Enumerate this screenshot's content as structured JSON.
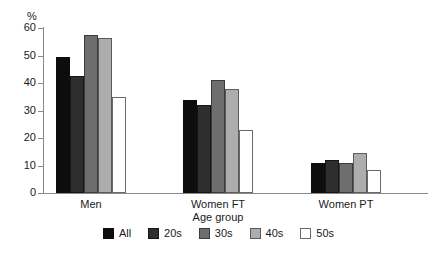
{
  "chart_data": {
    "type": "bar",
    "title": "",
    "xlabel": "Age group",
    "ylabel": "%",
    "ylim": [
      0,
      60
    ],
    "yticks": [
      0,
      10,
      20,
      30,
      40,
      50,
      60
    ],
    "ytick_labels": [
      "0",
      "10",
      "20",
      "30",
      "40",
      "50",
      "60"
    ],
    "grid": false,
    "legend_position": "bottom",
    "categories": [
      "Men",
      "Women FT",
      "Women PT"
    ],
    "series": [
      {
        "name": "All",
        "color": "#0d0d0d",
        "values": [
          49.5,
          34,
          11
        ]
      },
      {
        "name": "20s",
        "color": "#2e2e2e",
        "values": [
          42.5,
          32,
          12
        ]
      },
      {
        "name": "30s",
        "color": "#6e6e6e",
        "values": [
          57.5,
          41,
          11
        ]
      },
      {
        "name": "40s",
        "color": "#adadad",
        "values": [
          56.5,
          38,
          14.5
        ]
      },
      {
        "name": "50s",
        "color": "#ffffff",
        "values": [
          35,
          23,
          8.5
        ]
      }
    ]
  },
  "legend": {
    "items": [
      {
        "label": "All"
      },
      {
        "label": "20s"
      },
      {
        "label": "30s"
      },
      {
        "label": "40s"
      },
      {
        "label": "50s"
      }
    ]
  }
}
